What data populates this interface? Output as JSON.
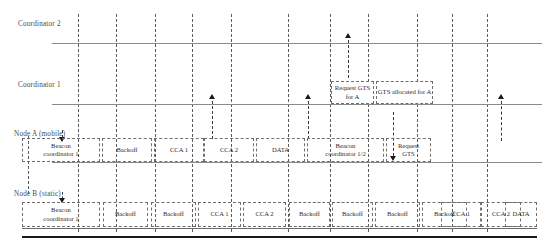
{
  "diagram": {
    "lanes": [
      {
        "id": "coordinator2",
        "label": "Coordinator 2"
      },
      {
        "id": "coordinator1",
        "label": "Coordinator 1"
      },
      {
        "id": "nodeA",
        "label": "Node A (mobile)"
      },
      {
        "id": "nodeB",
        "label": "Node B (static)"
      }
    ],
    "callouts": [
      {
        "id": "request-gts-for-a",
        "line1": "Request",
        "line2": "GTS for A"
      },
      {
        "id": "gts-allocated-for-a",
        "line1": "GTS",
        "line2": "allocated for A"
      }
    ],
    "nodeA_frames": [
      {
        "id": "beacon-coord-1",
        "line1": "Beacon",
        "line2": "coordinator 1"
      },
      {
        "id": "backoff-1",
        "line1": "Backoff",
        "line2": ""
      },
      {
        "id": "cca-1",
        "line1": "CCA 1",
        "line2": ""
      },
      {
        "id": "cca-2",
        "line1": "CCA 2",
        "line2": ""
      },
      {
        "id": "data-1",
        "line1": "DATA",
        "line2": ""
      },
      {
        "id": "beacon-coord-1-2",
        "line1": "Beacon",
        "line2": "coordinator 1/2"
      },
      {
        "id": "request-gts",
        "line1": "Request",
        "line2": "GTS"
      }
    ],
    "nodeB_frames": [
      {
        "id": "beacon-coord-1",
        "line1": "Beacon",
        "line2": "coordinator 1"
      },
      {
        "id": "backoff-1",
        "line1": "Backoff",
        "line2": ""
      },
      {
        "id": "backoff-2",
        "line1": "Backoff",
        "line2": ""
      },
      {
        "id": "cca-1",
        "line1": "CCA 1",
        "line2": ""
      },
      {
        "id": "cca-2",
        "line1": "CCA 2",
        "line2": ""
      },
      {
        "id": "backoff-3",
        "line1": "Backoff",
        "line2": ""
      },
      {
        "id": "backoff-4",
        "line1": "Backoff",
        "line2": ""
      },
      {
        "id": "backoff-5",
        "line1": "Backoff",
        "line2": ""
      },
      {
        "id": "backoff-6",
        "line1": "Backoff",
        "line2": ""
      },
      {
        "id": "backoff-7",
        "line1": "Backoff",
        "line2": ""
      },
      {
        "id": "cca-3",
        "line1": "CCA 1",
        "line2": ""
      },
      {
        "id": "cca-4",
        "line1": "CCA 2",
        "line2": ""
      },
      {
        "id": "data-2",
        "line1": "DATA",
        "line2": ""
      }
    ],
    "colors": {
      "axis": "#8a8a8a",
      "dash": "#5d5d5d",
      "frame_border": "#6f6f6f",
      "text": "#2e2e2e",
      "label_text": "#4a4a4a",
      "rule": "#1a1a1a",
      "background": "#ffffff"
    }
  }
}
